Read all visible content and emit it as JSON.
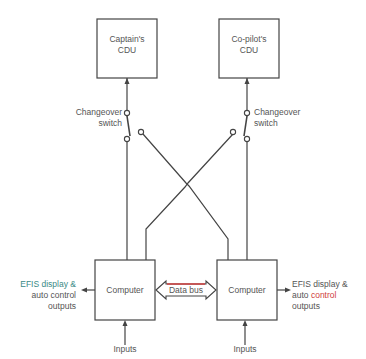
{
  "diagram": {
    "captain_cdu": {
      "line1": "Captain's",
      "line2": "CDU"
    },
    "copilot_cdu": {
      "line1": "Co-pilot's",
      "line2": "CDU"
    },
    "left_switch": {
      "line1": "Changeover",
      "line2": "switch"
    },
    "right_switch": {
      "line1": "Changeover",
      "line2": "switch"
    },
    "left_computer": "Computer",
    "right_computer": "Computer",
    "data_bus": "Data bus",
    "left_output": {
      "line1": "EFIS display &",
      "line2": "auto control",
      "line3": "outputs"
    },
    "right_output": {
      "line1": "EFIS display &",
      "line2_a": "auto ",
      "line2_b": "control",
      "line3": "outputs"
    },
    "left_inputs": "Inputs",
    "right_inputs": "Inputs",
    "colors": {
      "line": "#444444",
      "efis_teal": "#3a8a86",
      "bus_red": "#d04040"
    }
  }
}
